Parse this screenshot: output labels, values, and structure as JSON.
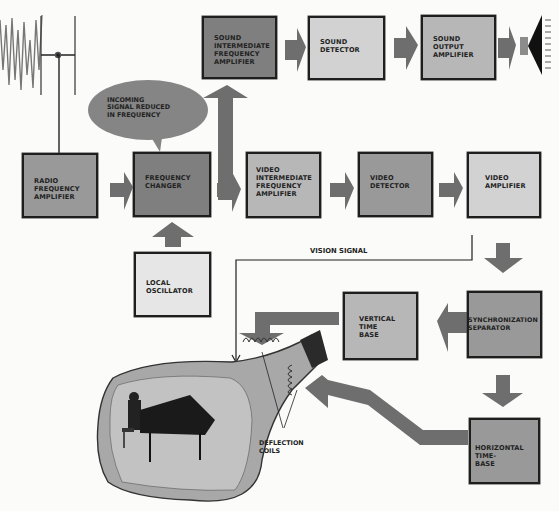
{
  "diagram": {
    "type": "block diagram",
    "colors": {
      "background": "#fbfbf9",
      "box_dark": "#7f7f7f",
      "box_mid": "#999999",
      "box_light": "#b7b7b7",
      "box_pale": "#d2d2d2",
      "arrow": "#6e6e6e",
      "outline": "#1e1e1e"
    },
    "blocks": {
      "radio_freq_amp": "RADIO\nFREQUENCY\nAMPLIFIER",
      "freq_changer": "FREQUENCY\nCHANGER",
      "local_osc": "LOCAL\nOSCILLATOR",
      "sound_if_amp": "SOUND\nINTERMEDIATE\nFREQUENCY\nAMPLIFIER",
      "sound_detector": "SOUND\nDETECTOR",
      "sound_output_amp": "SOUND\nOUTPUT\nAMPLIFIER",
      "video_if_amp": "VIDEO\nINTERMEDIATE\nFREQUENCY\nAMPLIFIER",
      "video_detector": "VIDEO\nDETECTOR",
      "video_amp": "VIDEO\nAMPLIFIER",
      "sync_separator": "SYNCHRONIZATION\nSEPARATOR",
      "vertical_time_base": "VERTICAL\nTIME\nBASE",
      "horizontal_time_base": "HORIZONTAL\nTIME-\nBASE"
    },
    "callouts": {
      "speech_bubble": "INCOMING\nSIGNAL REDUCED\nIN FREQUENCY",
      "vision_signal": "VISION SIGNAL",
      "deflection_coils": "DEFLECTION\nCOILS"
    },
    "illustrations": {
      "antenna": "antenna-with-waveform",
      "speaker": "loudspeaker",
      "crt": "picture-tube-showing-pianist"
    },
    "connections": [
      [
        "radio_freq_amp",
        "freq_changer"
      ],
      [
        "local_osc",
        "freq_changer"
      ],
      [
        "freq_changer",
        "sound_if_amp"
      ],
      [
        "freq_changer",
        "video_if_amp"
      ],
      [
        "sound_if_amp",
        "sound_detector"
      ],
      [
        "sound_detector",
        "sound_output_amp"
      ],
      [
        "sound_output_amp",
        "speaker"
      ],
      [
        "video_if_amp",
        "video_detector"
      ],
      [
        "video_detector",
        "video_amp"
      ],
      [
        "video_amp",
        "crt"
      ],
      [
        "video_amp",
        "sync_separator"
      ],
      [
        "sync_separator",
        "vertical_time_base"
      ],
      [
        "sync_separator",
        "horizontal_time_base"
      ],
      [
        "vertical_time_base",
        "deflection_coils"
      ],
      [
        "horizontal_time_base",
        "deflection_coils"
      ]
    ]
  }
}
